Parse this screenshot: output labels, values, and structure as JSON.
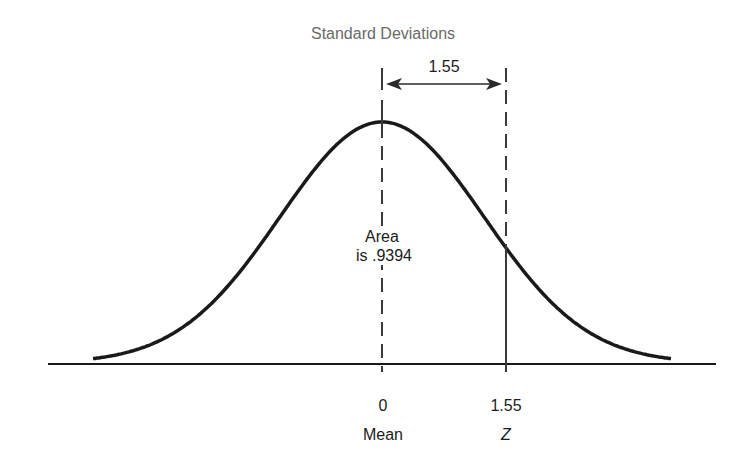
{
  "title": "Standard Deviations",
  "distance_label": "1.55",
  "area_label": {
    "line1": "Area",
    "line2": "is .9394"
  },
  "axis": {
    "ticks": [
      {
        "value": "0",
        "caption": "Mean"
      },
      {
        "value": "1.55",
        "caption": "Z"
      }
    ]
  },
  "colors": {
    "curve": "#1a1a1a",
    "axis": "#1a1a1a",
    "dashed": "#3a3a3a",
    "title": "#6a6a6a"
  },
  "chart_data": {
    "type": "line",
    "title": "Standard Deviations",
    "xlabel": "",
    "ylabel": "",
    "markers": [
      {
        "x": 0,
        "label": "Mean",
        "line": "dashed"
      },
      {
        "x": 1.55,
        "label": "Z",
        "line": "dashed above curve, solid below"
      }
    ],
    "annotations": [
      {
        "text": "1.55",
        "type": "double-arrow",
        "from": 0,
        "to": 1.55
      },
      {
        "text": "Area is .9394",
        "type": "region-label",
        "region": "z < 1.55"
      }
    ],
    "distribution": {
      "mean": 0,
      "sd": 1
    },
    "z_value": 1.55,
    "cumulative_area": 0.9394,
    "grid": false
  }
}
